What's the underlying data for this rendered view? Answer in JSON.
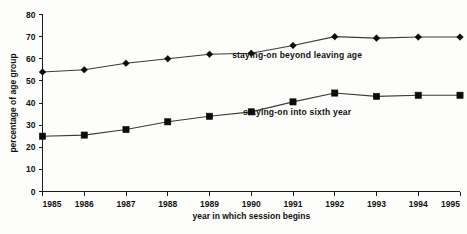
{
  "chart_data": {
    "type": "line",
    "title": "",
    "xlabel": "year in which session begins",
    "ylabel": "percentage of age group",
    "categories": [
      "1985",
      "1986",
      "1987",
      "1988",
      "1989",
      "1990",
      "1991",
      "1992",
      "1993",
      "1994",
      "1995"
    ],
    "x": [
      1985,
      1986,
      1987,
      1988,
      1989,
      1990,
      1991,
      1992,
      1993,
      1994,
      1995
    ],
    "xlim": [
      1985,
      1995
    ],
    "ylim": [
      0,
      80
    ],
    "y_ticks": [
      0,
      10,
      20,
      30,
      40,
      50,
      60,
      70,
      80
    ],
    "y_tick_labels": [
      "0",
      "10",
      "20",
      "30",
      "40",
      "50",
      "60",
      "70",
      "80"
    ],
    "grid": false,
    "legend_position": "inline-annotation",
    "series": [
      {
        "name": "staying-on beyond leaving age",
        "marker": "diamond",
        "values": [
          54,
          55,
          58,
          60,
          62,
          62.5,
          66,
          70,
          69.3,
          69.8,
          69.8
        ],
        "label_x": 1991.1,
        "label_y": 60.5
      },
      {
        "name": "staying-on into sixth year",
        "marker": "square",
        "values": [
          25,
          25.5,
          28,
          31.5,
          34,
          36,
          40.5,
          44.5,
          43,
          43.5,
          43.5
        ],
        "label_x": 1991.1,
        "label_y": 34.5
      }
    ]
  },
  "colors": {
    "line": "#3a3a3a",
    "marker": "#0b0b0b",
    "axis": "#1a1a1a",
    "text": "#111111",
    "background": "#fdfdfb"
  }
}
